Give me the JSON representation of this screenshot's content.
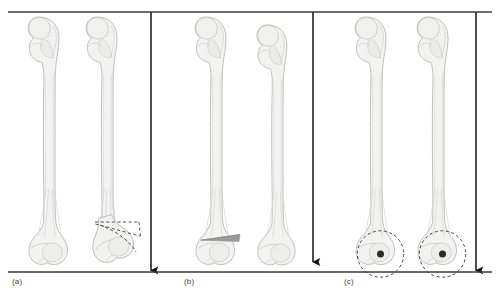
{
  "figure": {
    "type": "diagram",
    "background_color": "#ffffff",
    "width": 500,
    "height": 296
  },
  "style": {
    "bone_fill": "#f2f2f0",
    "bone_stroke": "#b9b9b9",
    "bone_inner_stroke": "#d2d2d0",
    "bone_shadow": "#e3e3e1",
    "wedge_fill": "#9a9a9a",
    "reference_line_color": "#3a3a3a",
    "arrow_color": "#111111",
    "dashed_color": "#3a3a3a",
    "pivot_dot_color": "#2b2b2b",
    "label_color": "#4a4a4a"
  },
  "reference_lines": {
    "top": {
      "name": "top-reference-line",
      "y": 12,
      "x_start": 8,
      "x_end": 492
    },
    "bottom": {
      "name": "bottom-reference-line",
      "y": 272,
      "x_start": 8,
      "x_end": 492
    }
  },
  "panels": [
    {
      "id": "a",
      "label": "(a)",
      "description": "Femur pair showing limb length discrepancy with distal angular deformity",
      "bones": [
        {
          "name": "femur-normal",
          "side": "left",
          "center_x": 45,
          "length_scale": 1.0,
          "deformed": false
        },
        {
          "name": "femur-deformed",
          "side": "right",
          "center_x": 103,
          "length_scale": 0.945,
          "deformed": true
        }
      ],
      "annotations": [
        {
          "type": "dashed-deformity-lines",
          "name": "angular-deformity-marker"
        }
      ],
      "measure_arrow": {
        "name": "length-measure-arrow-a",
        "x": 151,
        "y_start": 12,
        "y_end": 272
      }
    },
    {
      "id": "b",
      "label": "(b)",
      "description": "Femur pair with supracondylar closing wedge osteotomy marked on left bone",
      "bones": [
        {
          "name": "femur-with-wedge",
          "side": "left",
          "center_x": 212,
          "length_scale": 1.0,
          "deformed": false
        },
        {
          "name": "femur-corrected",
          "side": "right",
          "center_x": 273,
          "length_scale": 0.962,
          "deformed": false
        }
      ],
      "annotations": [
        {
          "type": "gray-wedge",
          "name": "osteotomy-wedge"
        }
      ],
      "measure_arrow": {
        "name": "length-measure-arrow-b",
        "x": 313,
        "y_start": 12,
        "y_end": 272
      }
    },
    {
      "id": "c",
      "label": "(c)",
      "description": "Femur pair with dashed rotation circles and central pivot points at distal ends",
      "bones": [
        {
          "name": "femur-pivot-left",
          "side": "left",
          "center_x": 372,
          "length_scale": 1.0,
          "deformed": false
        },
        {
          "name": "femur-pivot-right",
          "side": "right",
          "center_x": 434,
          "length_scale": 1.0,
          "deformed": false
        }
      ],
      "annotations": [
        {
          "type": "dashed-circle",
          "name": "rotation-circle-left"
        },
        {
          "type": "pivot-dot",
          "name": "pivot-point-left"
        },
        {
          "type": "dashed-circle",
          "name": "rotation-circle-right"
        },
        {
          "type": "pivot-dot",
          "name": "pivot-point-right"
        }
      ],
      "measure_arrow": {
        "name": "length-measure-arrow-c",
        "x": 476,
        "y_start": 12,
        "y_end": 272
      }
    }
  ]
}
